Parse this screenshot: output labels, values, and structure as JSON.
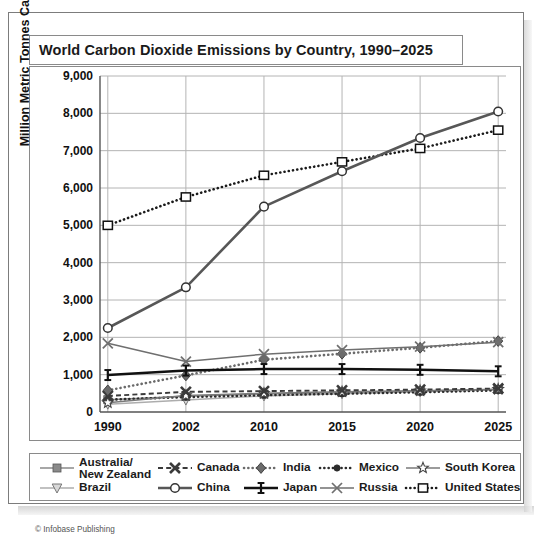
{
  "card": {
    "title": "World Carbon Dioxide Emissions by Country, 1990–2025",
    "copyright": "© Infobase Publishing"
  },
  "chart_data": {
    "type": "line",
    "title": "World Carbon Dioxide Emissions by Country, 1990–2025",
    "xlabel": "",
    "ylabel": "Million Metric Tonnes Carbon Dioxide",
    "categories": [
      "1990",
      "2002",
      "2010",
      "2015",
      "2020",
      "2025"
    ],
    "x": [
      1990,
      2002,
      2010,
      2015,
      2020,
      2025
    ],
    "ylim": [
      0,
      9000
    ],
    "yticks": [
      "0",
      "1,000",
      "2,000",
      "3,000",
      "4,000",
      "5,000",
      "6,000",
      "7,000",
      "8,000",
      "9,000"
    ],
    "ytick_values": [
      0,
      1000,
      2000,
      3000,
      4000,
      5000,
      6000,
      7000,
      8000,
      9000
    ],
    "grid": true,
    "legend_position": "below",
    "series": [
      {
        "name": "Australia/\nNew Zealand",
        "label": "Australia/ New Zealand",
        "marker": "square-filled",
        "line": "solid",
        "color": "#8a8a8a",
        "values": [
          330,
          420,
          480,
          520,
          560,
          600
        ]
      },
      {
        "name": "Brazil",
        "marker": "triangle-down",
        "line": "solid",
        "color": "#adadad",
        "values": [
          210,
          320,
          430,
          490,
          540,
          595
        ]
      },
      {
        "name": "Canada",
        "marker": "x-bold",
        "line": "dashed",
        "color": "#3a3a3a",
        "values": [
          430,
          540,
          560,
          580,
          600,
          630
        ]
      },
      {
        "name": "China",
        "marker": "circle-open",
        "line": "solid-thick",
        "color": "#575757",
        "values": [
          2250,
          3340,
          5500,
          6450,
          7340,
          8050
        ]
      },
      {
        "name": "India",
        "marker": "diamond-filled",
        "line": "dotted",
        "color": "#6b6b6b",
        "values": [
          580,
          980,
          1400,
          1560,
          1720,
          1900
        ]
      },
      {
        "name": "Japan",
        "marker": "ibeam",
        "line": "solid-thick",
        "color": "#111111",
        "values": [
          990,
          1110,
          1150,
          1150,
          1130,
          1090
        ]
      },
      {
        "name": "Mexico",
        "marker": "circle-small",
        "line": "dotted",
        "color": "#2b2b2b",
        "values": [
          330,
          400,
          450,
          490,
          530,
          580
        ]
      },
      {
        "name": "Russia",
        "marker": "x-thin",
        "line": "solid",
        "color": "#6f6f6f",
        "values": [
          1840,
          1350,
          1550,
          1660,
          1750,
          1870
        ]
      },
      {
        "name": "South Korea",
        "marker": "star-open",
        "line": "solid",
        "color": "#7a7a7a",
        "values": [
          250,
          440,
          500,
          540,
          570,
          610
        ]
      },
      {
        "name": "United States",
        "marker": "square-open",
        "line": "dotted",
        "color": "#1a1a1a",
        "values": [
          5000,
          5760,
          6340,
          6700,
          7060,
          7550
        ]
      }
    ]
  },
  "legend": {
    "items": [
      {
        "label": "Australia/ New Zealand",
        "key": "square-filled-solid"
      },
      {
        "label": "Canada",
        "key": "x-bold-dashed"
      },
      {
        "label": "India",
        "key": "diamond-dotted"
      },
      {
        "label": "Mexico",
        "key": "circle-small-dotted"
      },
      {
        "label": "South Korea",
        "key": "star-open-solid"
      },
      {
        "label": "Brazil",
        "key": "triangle-down-solid"
      },
      {
        "label": "China",
        "key": "circle-open-solid"
      },
      {
        "label": "Japan",
        "key": "ibeam-solid"
      },
      {
        "label": "Russia",
        "key": "x-thin-solid"
      },
      {
        "label": "United States",
        "key": "square-open-dotted"
      }
    ]
  }
}
